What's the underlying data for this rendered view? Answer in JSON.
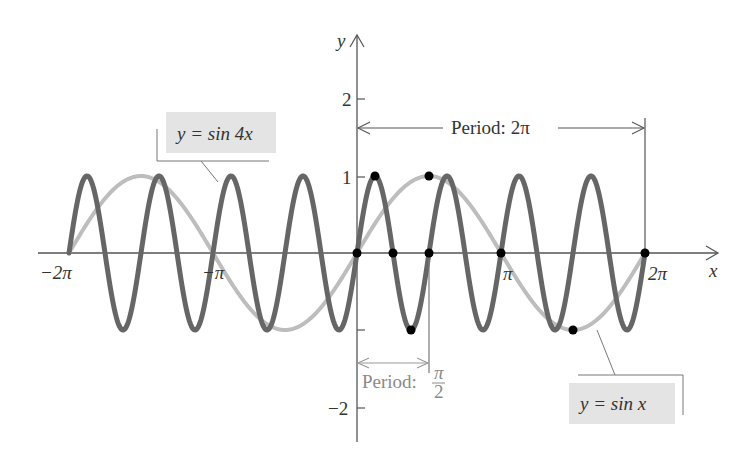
{
  "chart_data": {
    "type": "line",
    "title": "",
    "xlabel": "x",
    "ylabel": "y",
    "xlim": [
      -6.283,
      6.283
    ],
    "ylim": [
      -2.5,
      2.8
    ],
    "grid": false,
    "x_ticks": [
      {
        "value": -6.2832,
        "label": "−2π"
      },
      {
        "value": -3.1416,
        "label": "−π"
      },
      {
        "value": 3.1416,
        "label": "π"
      },
      {
        "value": 6.2832,
        "label": "2π"
      }
    ],
    "y_ticks": [
      {
        "value": 2,
        "label": "2"
      },
      {
        "value": 1,
        "label": "1"
      },
      {
        "value": -1,
        "label": ""
      },
      {
        "value": -2,
        "label": "−2"
      }
    ],
    "series": [
      {
        "name": "y = sin 4x",
        "function": "sin(4x)",
        "domain": [
          -6.2832,
          6.2832
        ],
        "color": "#666666",
        "width": 5
      },
      {
        "name": "y = sin x",
        "function": "sin(x)",
        "domain": [
          -6.2832,
          6.2832
        ],
        "color": "#bdbdbd",
        "width": 4
      }
    ],
    "marked_points": [
      {
        "x": 0,
        "y": 0
      },
      {
        "x": 0.3927,
        "y": 1
      },
      {
        "x": 0.7854,
        "y": 0
      },
      {
        "x": 1.1781,
        "y": -1
      },
      {
        "x": 1.5708,
        "y": 0
      },
      {
        "x": 1.5708,
        "y": 1
      },
      {
        "x": 3.1416,
        "y": 0
      },
      {
        "x": 4.7124,
        "y": -1
      },
      {
        "x": 6.2832,
        "y": 0
      }
    ],
    "annotations": [
      {
        "text": "Period: 2π",
        "from_x": 0,
        "to_x": 6.2832,
        "y": 1.6,
        "color": "#333333"
      },
      {
        "text_main": "Period:",
        "text_num": "π",
        "text_den": "2",
        "from_x": 0,
        "to_x": 1.5708,
        "y": -1.4,
        "color": "#8a8a8a"
      }
    ],
    "legend": [
      {
        "label": "y = sin 4x",
        "position": "upper-left"
      },
      {
        "label": "y = sin x",
        "position": "lower-right"
      }
    ]
  },
  "labels": {
    "x_axis": "x",
    "y_axis": "y",
    "tick_neg2pi": "−2π",
    "tick_negpi": "−π",
    "tick_pi": "π",
    "tick_2pi": "2π",
    "tick_y2": "2",
    "tick_y1": "1",
    "tick_yneg2": "−2",
    "period_big": "Period:  2π",
    "period_small": "Period:",
    "period_small_num": "π",
    "period_small_den": "2",
    "legend_sin4x": "y = sin 4x",
    "legend_sinx": "y = sin x"
  }
}
